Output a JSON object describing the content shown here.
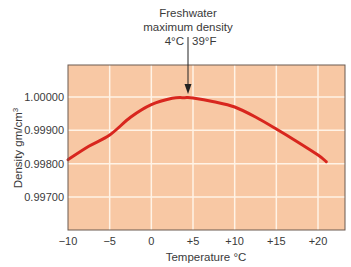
{
  "annotation": {
    "line1": "Freshwater",
    "line2": "maximum density",
    "line3_c": "4°C",
    "line3_f": "39°F"
  },
  "colors": {
    "plot_bg": "#F8C8A4",
    "grid": "#FFF3E6",
    "curve": "#D8261E",
    "border": "#6b5a50",
    "text": "#3a3a3a"
  },
  "chart_data": {
    "type": "line",
    "xlabel": "Temperature °C",
    "ylabel": "Density gm/cm³",
    "xlim": [
      -10,
      23
    ],
    "ylim": [
      0.9966,
      1.0003
    ],
    "x_ticks": [
      -10,
      -5,
      0,
      5,
      10,
      15,
      20
    ],
    "x_tick_labels": [
      "−10",
      "−5",
      "0",
      "+5",
      "+10",
      "+15",
      "+20"
    ],
    "y_ticks": [
      0.997,
      0.998,
      0.999,
      1.0
    ],
    "y_tick_labels": [
      "0.99700",
      "0.99800",
      "0.99900",
      "1.00000"
    ],
    "grid": true,
    "series": [
      {
        "name": "Freshwater density",
        "x": [
          -10,
          -7.5,
          -5,
          -2.5,
          0,
          2.5,
          4,
          5,
          7.5,
          10,
          12.5,
          15,
          17.5,
          20,
          21
        ],
        "values": [
          0.99812,
          0.99852,
          0.99886,
          0.99939,
          0.99977,
          0.99996,
          0.99998,
          0.99997,
          0.99986,
          0.9997,
          0.9994,
          0.99904,
          0.99866,
          0.99826,
          0.99806
        ]
      }
    ],
    "annotations": [
      {
        "text": "Freshwater maximum density 4°C | 39°F",
        "x": 4,
        "y": 1.0,
        "arrow": true
      }
    ]
  }
}
